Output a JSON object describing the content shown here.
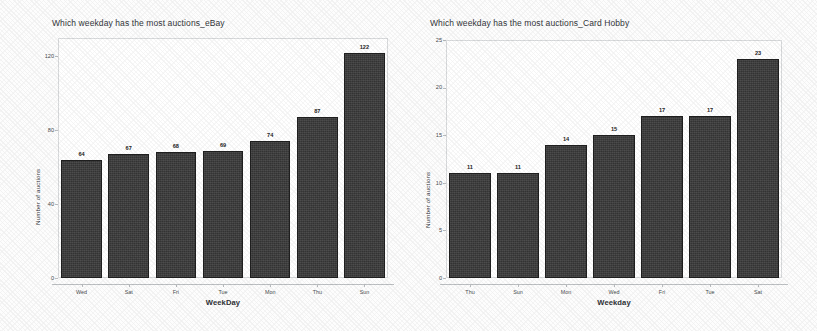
{
  "figure": {
    "background_color": "#ffffff",
    "bar_color": "#3b3b3b",
    "axis_color": "#bdc0c3",
    "text_color": "#2a2a2a"
  },
  "chart_data": [
    {
      "type": "bar",
      "id": "ebay",
      "title": "Which weekday has the most auctions_eBay",
      "xlabel": "WeekDay",
      "ylabel": "Number of auctions",
      "categories": [
        "Wed",
        "Sat",
        "Fri",
        "Tue",
        "Mon",
        "Thu",
        "Sun"
      ],
      "values": [
        64,
        67,
        68,
        69,
        74,
        87,
        122
      ],
      "value_labels": [
        "64",
        "67",
        "68",
        "69",
        "74",
        "87",
        "122"
      ],
      "ylim": [
        0,
        130
      ],
      "yticks": [
        0,
        40,
        80,
        120
      ],
      "ytick_labels": [
        "0",
        "40",
        "80",
        "120"
      ],
      "grid": false,
      "legend": "none"
    },
    {
      "type": "bar",
      "id": "card-hobby",
      "title": "Which weekday has the most auctions_Card Hobby",
      "xlabel": "Weekday",
      "ylabel": "Number of auctions",
      "categories": [
        "Thu",
        "Sun",
        "Mon",
        "Wed",
        "Fri",
        "Tue",
        "Sat"
      ],
      "values": [
        11,
        11,
        14,
        15,
        17,
        17,
        23
      ],
      "value_labels": [
        "11",
        "11",
        "14",
        "15",
        "17",
        "17",
        "23"
      ],
      "ylim": [
        0,
        25
      ],
      "yticks": [
        0,
        5,
        10,
        15,
        20,
        25
      ],
      "ytick_labels": [
        "0",
        "5",
        "10",
        "15",
        "20",
        "25"
      ],
      "grid": false,
      "legend": "none"
    }
  ]
}
